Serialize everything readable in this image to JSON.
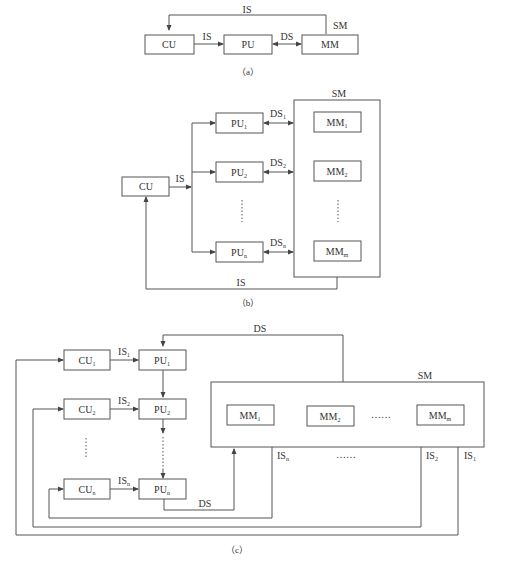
{
  "diagram_a": {
    "caption": "（a）",
    "boxes": {
      "cu": "CU",
      "pu": "PU",
      "mm": "MM"
    },
    "labels": {
      "is_top": "IS",
      "is_mid": "IS",
      "ds": "DS",
      "sm": "SM"
    }
  },
  "diagram_b": {
    "caption": "（b）",
    "cu": "CU",
    "sm": "SM",
    "is_out": "IS",
    "is_back": "IS",
    "pu": [
      {
        "base": "PU",
        "sub": "1"
      },
      {
        "base": "PU",
        "sub": "2"
      },
      {
        "base": "PU",
        "sub": "n"
      }
    ],
    "mm": [
      {
        "base": "MM",
        "sub": "1"
      },
      {
        "base": "MM",
        "sub": "2"
      },
      {
        "base": "MM",
        "sub": "m"
      }
    ],
    "ds": [
      {
        "base": "DS",
        "sub": "1"
      },
      {
        "base": "DS",
        "sub": "2"
      },
      {
        "base": "DS",
        "sub": "n"
      }
    ],
    "ellipsis": "⋮"
  },
  "diagram_c": {
    "caption": "（c）",
    "sm": "SM",
    "ds_top": "DS",
    "ds_bottom": "DS",
    "cu": [
      {
        "base": "CU",
        "sub": "1"
      },
      {
        "base": "CU",
        "sub": "2"
      },
      {
        "base": "CU",
        "sub": "n"
      }
    ],
    "pu": [
      {
        "base": "PU",
        "sub": "1"
      },
      {
        "base": "PU",
        "sub": "2"
      },
      {
        "base": "PU",
        "sub": "n"
      }
    ],
    "is_h": [
      {
        "base": "IS",
        "sub": "1"
      },
      {
        "base": "IS",
        "sub": "2"
      },
      {
        "base": "IS",
        "sub": "n"
      }
    ],
    "mm": [
      {
        "base": "MM",
        "sub": "1"
      },
      {
        "base": "MM",
        "sub": "2"
      },
      {
        "base": "MM",
        "sub": "m"
      }
    ],
    "mm_ellipsis": "……",
    "is_out": [
      {
        "base": "IS",
        "sub": "n"
      },
      {
        "base": "IS",
        "sub": "2"
      },
      {
        "base": "IS",
        "sub": "1"
      }
    ],
    "is_ellipsis": "……"
  }
}
